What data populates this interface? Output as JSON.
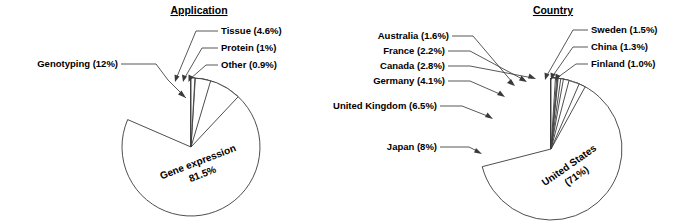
{
  "figure": {
    "background_color": "#ffffff",
    "stroke_color": "#3a3a3a"
  },
  "charts": [
    {
      "id": "application",
      "title": "Application",
      "center": {
        "x": 191,
        "y": 147
      },
      "radius": 69
    },
    {
      "id": "country",
      "title": "Country",
      "center": {
        "x": 551,
        "y": 149
      },
      "radius": 71
    }
  ],
  "chart_data": [
    {
      "type": "pie",
      "title": "Application",
      "xlabel": "",
      "ylabel": "",
      "legend": "none",
      "grid": false,
      "categories": [
        "Gene expression",
        "Genotyping",
        "Tissue",
        "Protein",
        "Other"
      ],
      "values": [
        81.5,
        12,
        4.6,
        1,
        0.9
      ],
      "labels": [
        "Gene expression 81.5%",
        "Genotyping (12%)",
        "Tissue (4.6%)",
        "Protein (1%)",
        "Other (0.9%)"
      ],
      "units": "percent",
      "annotations": {
        "inside_slice": [
          "Gene expression",
          "81.5%"
        ],
        "callouts_left": [
          "Genotyping (12%)"
        ],
        "callouts_right": [
          "Tissue (4.6%)",
          "Protein (1%)",
          "Other (0.9%)"
        ]
      }
    },
    {
      "type": "pie",
      "title": "Country",
      "xlabel": "",
      "ylabel": "",
      "legend": "none",
      "grid": false,
      "categories": [
        "United States",
        "Japan",
        "United Kingdom",
        "Germany",
        "Canada",
        "France",
        "Australia",
        "Sweden",
        "China",
        "Finland"
      ],
      "values": [
        71,
        8,
        6.5,
        4.1,
        2.8,
        2.2,
        1.6,
        1.5,
        1.3,
        1.0
      ],
      "labels": [
        "United States (71%)",
        "Japan (8%)",
        "United Kingdom (6.5%)",
        "Germany (4.1%)",
        "Canada (2.8%)",
        "France (2.2%)",
        "Australia (1.6%)",
        "Sweden (1.5%)",
        "China (1.3%)",
        "Finland (1.0%)"
      ],
      "units": "percent",
      "annotations": {
        "inside_slice": [
          "United States",
          "(71%)"
        ],
        "callouts_left": [
          "Australia (1.6%)",
          "France (2.2%)",
          "Canada (2.8%)",
          "Germany (4.1%)",
          "United Kingdom (6.5%)",
          "Japan (8%)"
        ],
        "callouts_right": [
          "Sweden (1.5%)",
          "China (1.3%)",
          "Finland (1.0%)"
        ]
      }
    }
  ],
  "application_chart": {
    "title": "Application",
    "inner_line1": "Gene expression",
    "inner_line2": "81.5%",
    "callouts": [
      {
        "name": "genotyping",
        "label": "Genotyping (12%)"
      },
      {
        "name": "tissue",
        "label": "Tissue (4.6%)"
      },
      {
        "name": "protein",
        "label": "Protein (1%)"
      },
      {
        "name": "other",
        "label": "Other (0.9%)"
      }
    ]
  },
  "country_chart": {
    "title": "Country",
    "inner_line1": "United States",
    "inner_line2": "(71%)",
    "callouts": [
      {
        "name": "australia",
        "label": "Australia (1.6%)"
      },
      {
        "name": "france",
        "label": "France (2.2%)"
      },
      {
        "name": "canada",
        "label": "Canada (2.8%)"
      },
      {
        "name": "germany",
        "label": "Germany (4.1%)"
      },
      {
        "name": "united-kingdom",
        "label": "United Kingdom (6.5%)"
      },
      {
        "name": "japan",
        "label": "Japan (8%)"
      },
      {
        "name": "sweden",
        "label": "Sweden (1.5%)"
      },
      {
        "name": "china",
        "label": "China (1.3%)"
      },
      {
        "name": "finland",
        "label": "Finland (1.0%)"
      }
    ]
  }
}
